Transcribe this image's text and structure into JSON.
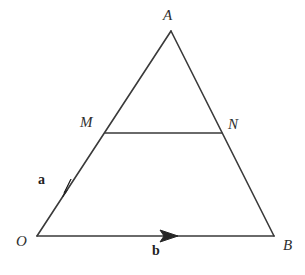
{
  "figure": {
    "kind": "geometry-diagram",
    "background_color": "#ffffff",
    "stroke_color": "#3a3a3a",
    "stroke_width": 1.6,
    "width": 305,
    "height": 275,
    "points": {
      "O": {
        "label": "O",
        "x": 37,
        "y": 236
      },
      "A": {
        "label": "A",
        "x": 171,
        "y": 31
      },
      "B": {
        "label": "B",
        "x": 274,
        "y": 236
      },
      "M": {
        "label": "M",
        "x": 105,
        "y": 133
      },
      "N": {
        "label": "N",
        "x": 222,
        "y": 133
      }
    },
    "segments": [
      {
        "name": "OA",
        "from": "O",
        "to": "A"
      },
      {
        "name": "AB",
        "from": "A",
        "to": "B"
      },
      {
        "name": "OB",
        "from": "O",
        "to": "B"
      },
      {
        "name": "MN",
        "from": "M",
        "to": "N"
      }
    ],
    "vectors": [
      {
        "name": "a",
        "label": "a",
        "along": "OA",
        "arrow_tip_x": 71,
        "arrow_tip_y": 180,
        "arrow_tail_x": 61,
        "arrow_tail_y": 195
      },
      {
        "name": "b",
        "label": "b",
        "along": "OB",
        "arrow_tip_x": 177,
        "arrow_tip_y": 236,
        "arrow_tail_x": 161,
        "arrow_tail_y": 236
      }
    ]
  }
}
